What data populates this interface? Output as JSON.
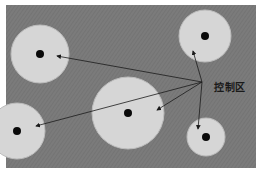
{
  "diagram": {
    "label": "控制区",
    "label_pos": {
      "x": 214,
      "y": 79
    },
    "colors": {
      "background": "#7b7b7b",
      "zone_fill": "#d6d6d6",
      "zone_stroke": "#bdbdbd",
      "center_dot": "#0a0a0a",
      "arrow": "#1a1a1a"
    },
    "field": {
      "x": 6,
      "y": 5,
      "width": 250,
      "height": 163
    },
    "arrow_origin": {
      "x": 202,
      "y": 82
    },
    "zones": [
      {
        "id": "top-left",
        "cx": 40,
        "cy": 54,
        "r": 29,
        "arrow_tip": {
          "x": 57,
          "y": 56
        }
      },
      {
        "id": "top-right",
        "cx": 205,
        "cy": 36,
        "r": 26,
        "arrow_tip": {
          "x": 193,
          "y": 51
        }
      },
      {
        "id": "center",
        "cx": 128,
        "cy": 113,
        "r": 36,
        "arrow_tip": {
          "x": 157,
          "y": 110
        }
      },
      {
        "id": "bottom-left",
        "cx": 17,
        "cy": 131,
        "r": 28,
        "arrow_tip": {
          "x": 36,
          "y": 126
        }
      },
      {
        "id": "bottom-right",
        "cx": 206,
        "cy": 137,
        "r": 19,
        "arrow_tip": {
          "x": 198,
          "y": 129
        }
      }
    ]
  }
}
